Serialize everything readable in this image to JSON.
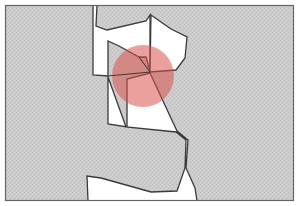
{
  "figure": {
    "width": 299,
    "height": 206,
    "background_color": "#ffffff"
  },
  "frame": {
    "label": "image-border",
    "x": 5,
    "y": 5,
    "width": 289,
    "height": 196,
    "stroke_color": "#6b6560",
    "stroke_width": 1.2,
    "fill_color": "#c9c9c9"
  },
  "body": {
    "label": "solid-material-region",
    "fill_color": "#c9c9c9",
    "texture": "fine stipple"
  },
  "crack": {
    "label": "crack-void-region",
    "fill_color": "#ffffff",
    "stroke_color": "#3a3a3a",
    "stroke_width": 1.3,
    "upper_flank_points": "97,6 95,27 106,30 147,22 150,16 170,28 186,36 184,58 175,71 149,72 151,63 147,57 141,57 120,46 107,41 108,76 94,75 93,6",
    "upper_wedge_points": "152,16 171,29 187,37 185,58 176,70 150,72",
    "lower_flank_points": "108,76 108,124 125,127 176,132 186,140 185,168 177,191 150,192 100,178 87,176 88,196 196,196 194,186 186,168 188,140 178,130 128,126 127,79 120,78",
    "tip_x": 150,
    "tip_y": 72
  },
  "process_zone": {
    "label": "process-zone-circle",
    "center_x": 143,
    "center_y": 76,
    "radius": 31,
    "fill_color": "#d9534f",
    "fill_opacity": 0.55,
    "stroke": "none"
  },
  "icons": {
    "crack_tip": "crack-tip-icon",
    "process_zone": "process-zone-icon"
  }
}
